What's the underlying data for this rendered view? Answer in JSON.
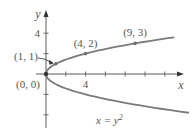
{
  "chart_data": {
    "type": "line",
    "title": "",
    "xlabel": "x",
    "ylabel": "y",
    "xlim": [
      0,
      13.5
    ],
    "ylim": [
      -5.5,
      6
    ],
    "grid": false,
    "x_ticks": [
      2,
      4,
      6,
      8,
      10,
      12
    ],
    "x_tick_labels": {
      "4": "4"
    },
    "y_ticks": [
      -4,
      -2,
      2,
      4
    ],
    "y_tick_labels": {
      "4": "4"
    },
    "series": [
      {
        "name": "x = y^2",
        "equation": "x = y²",
        "type": "parametric",
        "y_range": [
          -3.8,
          3.6
        ],
        "color": "#7a7a7a"
      }
    ],
    "points": [
      {
        "x": 0,
        "y": 0,
        "label": "(0, 0)"
      },
      {
        "x": 1,
        "y": 1,
        "label": "(1, 1)"
      },
      {
        "x": 4,
        "y": 2,
        "label": "(4, 2)"
      },
      {
        "x": 9,
        "y": 3,
        "label": "(9, 3)"
      }
    ],
    "annotations": [
      {
        "text": "x = y",
        "superscript": "2",
        "anchor": "below-curve"
      }
    ]
  }
}
